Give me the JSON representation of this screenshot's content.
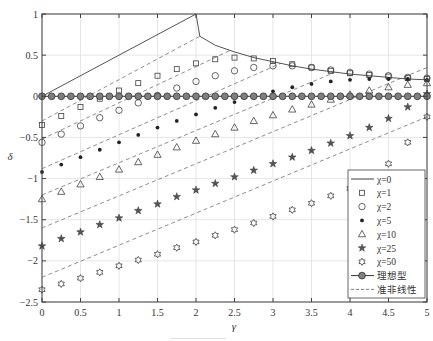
{
  "chart_data": {
    "type": "line",
    "title": "",
    "xlabel": "γ",
    "ylabel": "δ",
    "xlim": [
      0,
      5
    ],
    "ylim": [
      -2.5,
      1
    ],
    "xticks": [
      "0",
      "0.5",
      "1",
      "1.5",
      "2",
      "2.5",
      "3",
      "3.5",
      "4",
      "4.5",
      "5"
    ],
    "yticks": [
      "1",
      "0.5",
      "0",
      "-0.5",
      "-1",
      "-1.5",
      "-2",
      "-2.5"
    ],
    "grid": true,
    "legend_position": "lower right",
    "x": [
      0,
      0.25,
      0.5,
      0.75,
      1,
      1.25,
      1.5,
      1.75,
      2,
      2.25,
      2.5,
      2.75,
      3,
      3.25,
      3.5,
      3.75,
      4,
      4.25,
      4.5,
      4.75,
      5
    ],
    "series": [
      {
        "name": "χ=0",
        "marker": "line",
        "style": "solid",
        "x": [
          0,
          2,
          2.05,
          2.25,
          2.5,
          2.75,
          3,
          3.25,
          3.5,
          3.75,
          4,
          4.25,
          4.5,
          4.75,
          5
        ],
        "values": [
          0,
          1,
          0.73,
          0.62,
          0.54,
          0.47,
          0.42,
          0.37,
          0.33,
          0.3,
          0.27,
          0.25,
          0.23,
          0.21,
          0.2
        ]
      },
      {
        "name": "χ=1",
        "marker": "square",
        "values": [
          -0.35,
          -0.24,
          -0.13,
          -0.03,
          0.07,
          0.16,
          0.25,
          0.33,
          0.4,
          0.45,
          0.47,
          0.46,
          0.43,
          0.39,
          0.35,
          0.31,
          0.28,
          0.26,
          0.24,
          0.22,
          0.21
        ]
      },
      {
        "name": "χ=2",
        "marker": "circle",
        "values": [
          -0.56,
          -0.46,
          -0.36,
          -0.26,
          -0.17,
          -0.08,
          0.01,
          0.1,
          0.18,
          0.25,
          0.31,
          0.35,
          0.37,
          0.37,
          0.35,
          0.32,
          0.29,
          0.27,
          0.25,
          0.23,
          0.22
        ]
      },
      {
        "name": "χ=5",
        "marker": "asterisk-dot",
        "values": [
          -0.92,
          -0.83,
          -0.74,
          -0.65,
          -0.56,
          -0.47,
          -0.38,
          -0.3,
          -0.22,
          -0.14,
          -0.07,
          0.0,
          0.06,
          0.11,
          0.15,
          0.18,
          0.2,
          0.21,
          0.21,
          0.21,
          0.2
        ]
      },
      {
        "name": "χ=10",
        "marker": "triangle",
        "values": [
          -1.25,
          -1.16,
          -1.07,
          -0.98,
          -0.89,
          -0.8,
          -0.71,
          -0.62,
          -0.54,
          -0.46,
          -0.38,
          -0.3,
          -0.23,
          -0.16,
          -0.1,
          -0.04,
          0.02,
          0.07,
          0.11,
          0.14,
          0.16
        ]
      },
      {
        "name": "χ=25",
        "marker": "pentagram",
        "values": [
          -1.82,
          -1.73,
          -1.65,
          -1.56,
          -1.48,
          -1.39,
          -1.31,
          -1.22,
          -1.14,
          -1.06,
          -0.98,
          -0.9,
          -0.82,
          -0.74,
          -0.66,
          -0.57,
          -0.48,
          -0.38,
          -0.27,
          -0.13,
          0.03
        ]
      },
      {
        "name": "χ=50",
        "marker": "hexagram",
        "values": [
          -2.35,
          -2.28,
          -2.21,
          -2.14,
          -2.06,
          -1.99,
          -1.92,
          -1.84,
          -1.77,
          -1.69,
          -1.62,
          -1.54,
          -1.46,
          -1.38,
          -1.3,
          -1.21,
          -1.12,
          -0.99,
          -0.82,
          -0.56,
          -0.25
        ]
      },
      {
        "name": "理想型",
        "marker": "filled-circle-line",
        "values": [
          0,
          0,
          0,
          0,
          0,
          0,
          0,
          0,
          0,
          0,
          0,
          0,
          0,
          0,
          0,
          0,
          0,
          0,
          0,
          0,
          0
        ]
      },
      {
        "name": "准非线性",
        "marker": "dashed-line",
        "style": "dashed",
        "lines": [
          {
            "chi": 1,
            "x": [
              0,
              2.05
            ],
            "values": [
              -0.3,
              0.73
            ]
          },
          {
            "chi": 2,
            "x": [
              0,
              2.45
            ],
            "values": [
              -0.52,
              0.56
            ]
          },
          {
            "chi": 5,
            "x": [
              0,
              3.1
            ],
            "values": [
              -0.88,
              0.4
            ]
          },
          {
            "chi": 10,
            "x": [
              0,
              3.8
            ],
            "values": [
              -1.2,
              0.29
            ]
          },
          {
            "chi": 25,
            "x": [
              0,
              5
            ],
            "values": [
              -1.6,
              0.35
            ]
          },
          {
            "chi": 50,
            "x": [
              0,
              5
            ],
            "values": [
              -2.2,
              -0.25
            ]
          }
        ]
      }
    ]
  },
  "legend": {
    "items": [
      {
        "label": "χ=0",
        "symbol": "line"
      },
      {
        "label": "χ=1",
        "symbol": "square"
      },
      {
        "label": "χ=2",
        "symbol": "circle"
      },
      {
        "label": "χ=5",
        "symbol": "asterisk-dot"
      },
      {
        "label": "χ=10",
        "symbol": "triangle"
      },
      {
        "label": "χ=25",
        "symbol": "pentagram"
      },
      {
        "label": "χ=50",
        "symbol": "hexagram"
      },
      {
        "label": "理想型",
        "symbol": "filled-circle-line"
      },
      {
        "label": "准非线性",
        "symbol": "dashed-line"
      }
    ]
  },
  "colors": {
    "axis": "#404040",
    "grid": "#e6e6e6",
    "series": "#404040",
    "dashed": "#808080",
    "ideal_fill": "#7f7f7f"
  }
}
